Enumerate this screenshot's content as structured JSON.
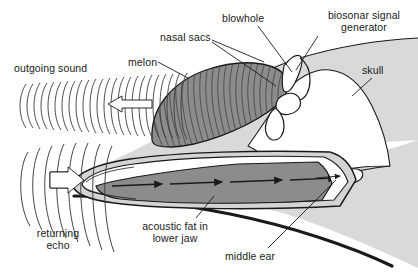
{
  "figure": {
    "background_color": "#ffffff",
    "ink_color": "#1a1a1a"
  },
  "colors": {
    "body_fill": "#d9d9d9",
    "skull_fill": "#ffffff",
    "melon_fill": "#8c8c8c",
    "acoustic_fat_fill": "#8c8c8c",
    "jaw_light_fill": "#d4d4d4",
    "outline": "#1a1a1a",
    "wave_line": "#3a3a3a"
  },
  "labels": [
    {
      "id": "outgoing-sound",
      "text": "outgoing sound",
      "x": 14,
      "y": 63,
      "lines": 1
    },
    {
      "id": "melon",
      "text": "melon",
      "x": 128,
      "y": 57,
      "lines": 1
    },
    {
      "id": "nasal-sacs",
      "text": "nasal sacs",
      "x": 160,
      "y": 32,
      "lines": 1
    },
    {
      "id": "blowhole",
      "text": "blowhole",
      "x": 222,
      "y": 13,
      "lines": 1
    },
    {
      "id": "biosonar-signal-generator",
      "text": "biosonar signal\ngenerator",
      "x": 314,
      "y": 10,
      "lines": 2
    },
    {
      "id": "skull",
      "text": "skull",
      "x": 362,
      "y": 65,
      "lines": 1
    },
    {
      "id": "returning-echo",
      "text": "returning\necho",
      "x": 18,
      "y": 228,
      "lines": 2
    },
    {
      "id": "acoustic-fat",
      "text": "acoustic fat in\nlower jaw",
      "x": 133,
      "y": 221,
      "lines": 2
    },
    {
      "id": "middle-ear",
      "text": "middle ear",
      "x": 225,
      "y": 251,
      "lines": 1
    }
  ],
  "features": {
    "outgoing_sound": {
      "arc_count": 24,
      "direction": "left",
      "arrow": "hollow-left-arrow"
    },
    "returning_echo": {
      "arc_count": 8,
      "direction": "right",
      "arrow": "hollow-right-arrow"
    },
    "melon_striations": 22,
    "jaw_arrows": 4,
    "middle_ear_arrow": 1
  }
}
